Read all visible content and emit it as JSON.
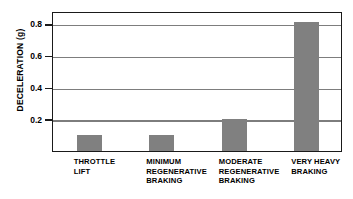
{
  "chart_data": {
    "type": "bar",
    "title": "",
    "xlabel": "",
    "ylabel": "DECELERATION (g)",
    "ylim": [
      0,
      0.88
    ],
    "yticks": [
      "0.2",
      "0.4",
      "0.6",
      "0.8"
    ],
    "ytick_values": [
      0.2,
      0.4,
      0.6,
      0.8
    ],
    "grid": "horizontal",
    "legend": "none",
    "bar_color": "#808080",
    "axis_color": "#1a1a1a",
    "gridline_color": "#7d7d7d",
    "categories": [
      "THROTTLE LIFT",
      "MINIMUM REGENERATIVE BRAKING",
      "MODERATE REGENERATIVE BRAKING",
      "VERY HEAVY BRAKING"
    ],
    "category_lines": [
      [
        "THROTTLE",
        "LIFT"
      ],
      [
        "MINIMUM",
        "REGENERATIVE",
        "BRAKING"
      ],
      [
        "MODERATE",
        "REGENERATIVE",
        "BRAKING"
      ],
      [
        "VERY HEAVY",
        "BRAKING"
      ]
    ],
    "values": [
      0.1,
      0.1,
      0.2,
      0.81
    ]
  }
}
